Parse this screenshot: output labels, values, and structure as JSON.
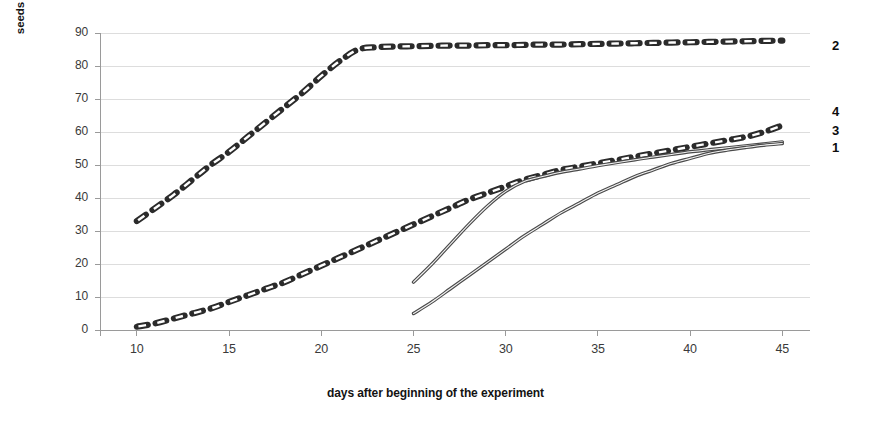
{
  "chart_data": {
    "type": "line",
    "title": "",
    "xlabel": "days after beginning of the experiment",
    "ylabel": "seeds germination, %",
    "xlim": [
      8,
      46.5
    ],
    "ylim": [
      0,
      90
    ],
    "xticks": [
      10,
      15,
      20,
      25,
      30,
      35,
      40,
      45
    ],
    "yticks": [
      0,
      10,
      20,
      30,
      40,
      50,
      60,
      70,
      80,
      90
    ],
    "xtick_labels": [
      "10",
      "15",
      "20",
      "25",
      "30",
      "35",
      "40",
      "45"
    ],
    "ytick_labels": [
      "0",
      "10",
      "20",
      "30",
      "40",
      "50",
      "60",
      "70",
      "80",
      "90"
    ],
    "grid": "horizontal",
    "legend_position": "right-edge-labels",
    "series": [
      {
        "name": "1",
        "label": "1",
        "style": "dashed",
        "color": "#2b2b2b",
        "x": [
          10,
          11,
          12,
          13,
          14,
          15,
          16,
          17,
          18,
          19,
          20,
          21,
          22,
          23,
          24,
          25,
          26,
          27,
          28,
          29,
          30,
          31,
          32,
          33,
          34,
          35,
          36,
          37,
          38,
          39,
          40,
          41,
          42,
          43,
          44,
          45
        ],
        "values": [
          1,
          2,
          3.5,
          5,
          6.5,
          8.5,
          10.5,
          12.5,
          14.5,
          17,
          19.5,
          22,
          24.5,
          27,
          29.5,
          32,
          34.5,
          37,
          39.5,
          41.5,
          43.5,
          45.5,
          47,
          48.5,
          49.5,
          50.5,
          51.5,
          52.5,
          53.5,
          54.5,
          55.5,
          56.5,
          57.5,
          58.5,
          60,
          62
        ]
      },
      {
        "name": "2",
        "label": "2",
        "style": "dashed",
        "color": "#2b2b2b",
        "x": [
          10,
          11,
          12,
          13,
          14,
          15,
          16,
          17,
          18,
          19,
          20,
          21,
          22,
          23,
          24,
          25,
          26,
          27,
          28,
          29,
          30,
          31,
          32,
          33,
          34,
          35,
          36,
          37,
          38,
          39,
          40,
          41,
          42,
          43,
          44,
          45
        ],
        "values": [
          33,
          37,
          41,
          45.5,
          50,
          54,
          58.5,
          63,
          67.5,
          72,
          77,
          81.5,
          85,
          85.7,
          85.9,
          86,
          86.1,
          86.2,
          86.2,
          86.3,
          86.3,
          86.4,
          86.5,
          86.5,
          86.6,
          86.7,
          86.8,
          86.9,
          87,
          87.1,
          87.2,
          87.3,
          87.4,
          87.5,
          87.6,
          87.7
        ]
      },
      {
        "name": "3",
        "label": "3",
        "style": "solid",
        "color": "#4a4a4a",
        "x": [
          25,
          26,
          27,
          28,
          29,
          30,
          31,
          32,
          33,
          34,
          35,
          36,
          37,
          38,
          39,
          40,
          41,
          42,
          43,
          44,
          45
        ],
        "values": [
          14.5,
          20,
          26,
          32,
          37.5,
          42,
          45,
          46.5,
          47.8,
          48.8,
          49.8,
          50.7,
          51.6,
          52.4,
          53.2,
          54,
          54.6,
          55.2,
          55.8,
          56.4,
          57
        ]
      },
      {
        "name": "4",
        "label": "4",
        "style": "solid",
        "color": "#4a4a4a",
        "x": [
          25,
          26,
          27,
          28,
          29,
          30,
          31,
          32,
          33,
          34,
          35,
          36,
          37,
          38,
          39,
          40,
          41,
          42,
          43,
          44,
          45
        ],
        "values": [
          5,
          8.5,
          12.5,
          16.5,
          20.5,
          24.5,
          28.5,
          32,
          35.5,
          38.5,
          41.5,
          44,
          46.5,
          48.5,
          50.5,
          52,
          53.5,
          54.5,
          55.3,
          56,
          56.5
        ]
      }
    ],
    "series_edge_labels": [
      {
        "label": "2",
        "value": 87.7
      },
      {
        "label": "4",
        "value": 62
      },
      {
        "label": "3",
        "value": 57
      },
      {
        "label": "1",
        "value": 56.5
      }
    ],
    "colors": {
      "gridline": "#d9d9d9",
      "axis": "#9a9a9a",
      "dashed_series": "#2b2b2b",
      "solid_series": "#4a4a4a",
      "text": "#3a3a3a"
    }
  }
}
